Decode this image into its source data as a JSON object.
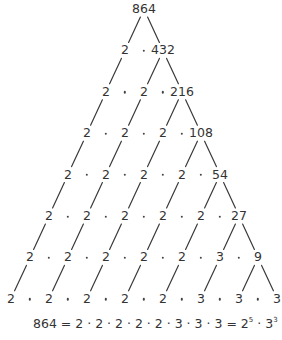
{
  "diagram": {
    "root": "864",
    "rows": [
      [
        "864"
      ],
      [
        "2",
        "432"
      ],
      [
        "2",
        "2",
        "216"
      ],
      [
        "2",
        "2",
        "2",
        "108"
      ],
      [
        "2",
        "2",
        "2",
        "2",
        "54"
      ],
      [
        "2",
        "2",
        "2",
        "2",
        "2",
        "27"
      ],
      [
        "2",
        "2",
        "2",
        "2",
        "2",
        "3",
        "9"
      ],
      [
        "2",
        "2",
        "2",
        "2",
        "2",
        "3",
        "3",
        "3"
      ]
    ],
    "separator": "·",
    "equation": {
      "lhs": "864",
      "eq1": "=",
      "expanded": "2 · 2 · 2 · 2 · 2 · 3 · 3 · 3",
      "eq2": "=",
      "base1": "2",
      "exp1": "5",
      "mid": " · ",
      "base2": "3",
      "exp2": "3"
    }
  },
  "colors": {
    "text": "#333333",
    "lines": "#3a3a3a",
    "background": "#ffffff"
  }
}
